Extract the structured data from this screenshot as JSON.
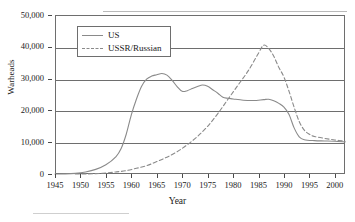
{
  "chart_data": {
    "type": "line",
    "title": "",
    "xlabel": "Year",
    "ylabel": "Warheads",
    "xlim": [
      1945,
      2002
    ],
    "ylim": [
      0,
      50000
    ],
    "grid": true,
    "legend_position": "upper-left-inside",
    "xticks": [
      1945,
      1950,
      1955,
      1960,
      1965,
      1970,
      1975,
      1980,
      1985,
      1990,
      1995,
      2000
    ],
    "xtick_labels": [
      "1945",
      "1950",
      "1955",
      "1960",
      "1965",
      "1970",
      "1975",
      "1980",
      "1985",
      "1990",
      "1995",
      "2000"
    ],
    "yticks": [
      0,
      10000,
      20000,
      30000,
      40000,
      50000
    ],
    "ytick_labels": [
      "0",
      "10,000",
      "20,000",
      "30,000",
      "40,000",
      "50,000"
    ],
    "series": [
      {
        "name": "US",
        "style": "solid",
        "color": "#8a8a8a",
        "x": [
          1945,
          1947,
          1949,
          1951,
          1953,
          1955,
          1957,
          1958,
          1959,
          1960,
          1961,
          1962,
          1963,
          1964,
          1965,
          1966,
          1967,
          1968,
          1969,
          1970,
          1971,
          1972,
          1973,
          1974,
          1975,
          1976,
          1977,
          1978,
          1979,
          1980,
          1982,
          1984,
          1986,
          1987,
          1988,
          1989,
          1990,
          1991,
          1992,
          1993,
          1994,
          1996,
          1998,
          2000,
          2002
        ],
        "values": [
          6,
          30,
          200,
          640,
          1450,
          2900,
          5500,
          8000,
          12500,
          18600,
          23500,
          27500,
          29800,
          30800,
          31200,
          31600,
          31100,
          29500,
          27500,
          26000,
          26200,
          26900,
          27500,
          28000,
          27600,
          26500,
          25400,
          24100,
          23800,
          23600,
          23200,
          23100,
          23400,
          23500,
          23000,
          22200,
          21000,
          18700,
          14500,
          11700,
          10800,
          10500,
          10400,
          10300,
          10100
        ]
      },
      {
        "name": "USSR/Russian",
        "style": "dashed",
        "color": "#8a8a8a",
        "x": [
          1949,
          1951,
          1953,
          1955,
          1957,
          1959,
          1961,
          1963,
          1965,
          1967,
          1969,
          1971,
          1973,
          1975,
          1977,
          1979,
          1981,
          1983,
          1985,
          1986,
          1987,
          1988,
          1989,
          1990,
          1991,
          1992,
          1993,
          1994,
          1995,
          1996,
          1998,
          2000,
          2002
        ],
        "values": [
          1,
          25,
          120,
          330,
          650,
          1050,
          1800,
          2600,
          3900,
          5300,
          7000,
          9200,
          11800,
          15000,
          19000,
          23500,
          28000,
          32500,
          38000,
          40500,
          39500,
          37000,
          33500,
          30500,
          26000,
          21000,
          16500,
          13800,
          12500,
          11800,
          11200,
          10700,
          10300
        ]
      }
    ],
    "legend_entries": [
      {
        "label": "US",
        "style": "solid"
      },
      {
        "label": "USSR/Russian",
        "style": "dashed"
      }
    ],
    "annotations": {
      "us_peak_year": 1966,
      "us_peak_value": 31600,
      "ussr_peak_year": 1986,
      "ussr_peak_value": 40500
    }
  },
  "axes": {
    "y_title": "Warheads",
    "x_title": "Year"
  }
}
